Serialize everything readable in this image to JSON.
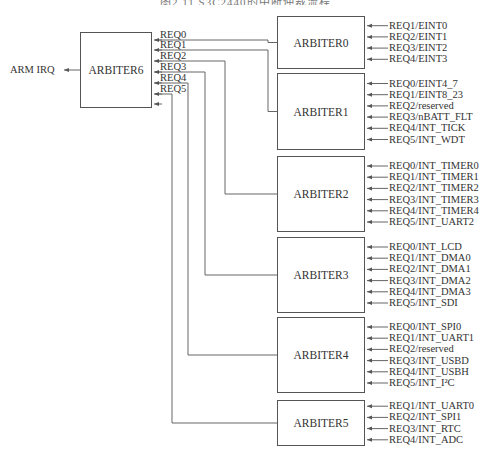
{
  "caption": "图2.11  S3C2440的中断仲裁流程",
  "output": {
    "label": "ARM IRQ"
  },
  "main_arbiter": {
    "name": "ARBITER6",
    "inputs": [
      "REQ0",
      "REQ1",
      "REQ2",
      "REQ3",
      "REQ4",
      "REQ5"
    ]
  },
  "arbiters": [
    {
      "name": "ARBITER0",
      "connects_to": "REQ0",
      "inputs": [
        "REQ1/EINT0",
        "REQ2/EINT1",
        "REQ3/EINT2",
        "REQ4/EINT3"
      ]
    },
    {
      "name": "ARBITER1",
      "connects_to": "REQ1",
      "inputs": [
        "REQ0/EINT4_7",
        "REQ1/EINT8_23",
        "REQ2/reserved",
        "REQ3/nBATT_FLT",
        "REQ4/INT_TICK",
        "REQ5/INT_WDT"
      ]
    },
    {
      "name": "ARBITER2",
      "connects_to": "REQ2",
      "inputs": [
        "REQ0/INT_TIMER0",
        "REQ1/INT_TIMER1",
        "REQ2/INT_TIMER2",
        "REQ3/INT_TIMER3",
        "REQ4/INT_TIMER4",
        "REQ5/INT_UART2"
      ]
    },
    {
      "name": "ARBITER3",
      "connects_to": "REQ3",
      "inputs": [
        "REQ0/INT_LCD",
        "REQ1/INT_DMA0",
        "REQ2/INT_DMA1",
        "REQ3/INT_DMA2",
        "REQ4/INT_DMA3",
        "REQ5/INT_SDI"
      ]
    },
    {
      "name": "ARBITER4",
      "connects_to": "REQ4",
      "inputs": [
        "REQ0/INT_SPI0",
        "REQ1/INT_UART1",
        "REQ2/reserved",
        "REQ3/INT_USBD",
        "REQ4/INT_USBH",
        "REQ5/INT_I²C"
      ]
    },
    {
      "name": "ARBITER5",
      "connects_to": "REQ5",
      "inputs": [
        "REQ1/INT_UART0",
        "REQ2/INT_SPI1",
        "REQ3/INT_RTC",
        "REQ4/INT_ADC"
      ]
    }
  ],
  "colors": {
    "line": "#555555",
    "text": "#333333",
    "background": "#ffffff"
  }
}
